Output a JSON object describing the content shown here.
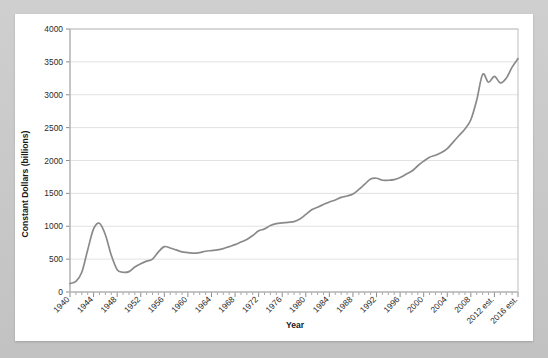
{
  "chart_data": {
    "type": "line",
    "title": "",
    "xlabel": "Year",
    "ylabel": "Constant Dollars (billions)",
    "ylim": [
      0,
      4000
    ],
    "xlim": [
      1940,
      2016
    ],
    "ytick_labels": [
      "0",
      "500",
      "1000",
      "1500",
      "2000",
      "2500",
      "3000",
      "3500",
      "4000"
    ],
    "ytick_values": [
      0,
      500,
      1000,
      1500,
      2000,
      2500,
      3000,
      3500,
      4000
    ],
    "xtick_labels": [
      "1940",
      "1944",
      "1948",
      "1952",
      "1956",
      "1960",
      "1964",
      "1968",
      "1972",
      "1976",
      "1980",
      "1984",
      "1988",
      "1992",
      "1996",
      "2000",
      "2004",
      "2008",
      "2012 est.",
      "2016 est."
    ],
    "xtick_values": [
      1940,
      1944,
      1948,
      1952,
      1956,
      1960,
      1964,
      1968,
      1972,
      1976,
      1980,
      1984,
      1988,
      1992,
      1996,
      2000,
      2004,
      2008,
      2012,
      2016
    ],
    "minor_xticks_every": 1,
    "grid": "horizontal",
    "legend": "none",
    "line_color": "#8a8a8a",
    "line_width": 1.7,
    "plot_bg": "#ffffff",
    "page_bg": "#c9c9c9",
    "series": [
      {
        "name": "Constant Dollars (billions)",
        "x": [
          1940,
          1941,
          1942,
          1943,
          1944,
          1945,
          1946,
          1947,
          1948,
          1949,
          1950,
          1951,
          1952,
          1953,
          1954,
          1955,
          1956,
          1957,
          1958,
          1959,
          1960,
          1961,
          1962,
          1963,
          1964,
          1965,
          1966,
          1967,
          1968,
          1969,
          1970,
          1971,
          1972,
          1973,
          1974,
          1975,
          1976,
          1977,
          1978,
          1979,
          1980,
          1981,
          1982,
          1983,
          1984,
          1985,
          1986,
          1987,
          1988,
          1989,
          1990,
          1991,
          1992,
          1993,
          1994,
          1995,
          1996,
          1997,
          1998,
          1999,
          2000,
          2001,
          2002,
          2003,
          2004,
          2005,
          2006,
          2007,
          2008,
          2009,
          2010,
          2011,
          2012,
          2013,
          2014,
          2015,
          2016
        ],
        "values": [
          130,
          160,
          300,
          640,
          960,
          1045,
          870,
          560,
          340,
          300,
          310,
          380,
          430,
          470,
          500,
          610,
          690,
          670,
          640,
          610,
          600,
          590,
          600,
          620,
          630,
          640,
          660,
          690,
          720,
          760,
          800,
          860,
          930,
          960,
          1010,
          1040,
          1050,
          1060,
          1070,
          1110,
          1180,
          1250,
          1290,
          1330,
          1370,
          1400,
          1440,
          1460,
          1490,
          1560,
          1640,
          1720,
          1730,
          1700,
          1700,
          1710,
          1740,
          1790,
          1840,
          1920,
          1990,
          2050,
          2080,
          2120,
          2180,
          2280,
          2380,
          2480,
          2620,
          2920,
          3310,
          3190,
          3280,
          3180,
          3250,
          3420,
          3550
        ]
      }
    ]
  },
  "axes": {
    "y_title": "Constant Dollars (billions)",
    "x_title": "Year"
  }
}
